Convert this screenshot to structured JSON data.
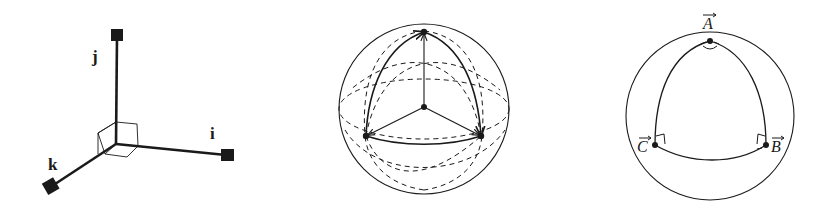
{
  "figure1": {
    "title": "Basis vectors",
    "labels": {
      "i": "i",
      "j": "j",
      "k": "k"
    }
  },
  "figure2": {
    "title": "Spherical triangle on sphere with radius vectors"
  },
  "figure3": {
    "title": "Spherical triangle with right angles",
    "labels": {
      "A": "A",
      "B": "B",
      "C": "C"
    },
    "vector_arrow": "→"
  },
  "colors": {
    "ink": "#1a1a1a",
    "background": "#ffffff"
  }
}
